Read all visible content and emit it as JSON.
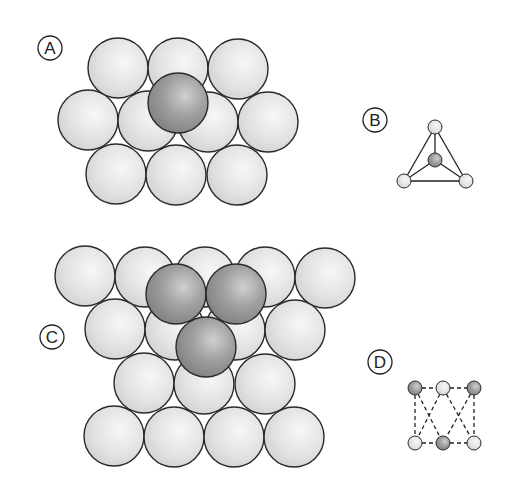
{
  "figure": {
    "panels": [
      {
        "id": "A",
        "label": "A",
        "description": "Atom sitting in a hollow between three atoms of a close-packed layer (tetrahedral site)"
      },
      {
        "id": "B",
        "label": "B",
        "description": "Tetrahedral arrangement: central atom with four neighbors"
      },
      {
        "id": "C",
        "label": "C",
        "description": "Second layer of three atoms above a close-packed layer (octahedral site)"
      },
      {
        "id": "D",
        "label": "D",
        "description": "Octahedral arrangement shown with dashed lines"
      }
    ],
    "colors": {
      "light_sphere": "#e4e4e4",
      "dark_sphere": "#9a9a9a",
      "outline": "#2a2a2a",
      "background": "#ffffff"
    }
  },
  "labels": {
    "A": "A",
    "B": "B",
    "C": "C",
    "D": "D"
  }
}
